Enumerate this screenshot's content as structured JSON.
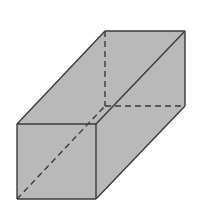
{
  "diagram": {
    "type": "rectangular-prism",
    "fill_color": "#b9b9b9",
    "stroke_color": "#3a3a3a",
    "background": "#ffffff",
    "vertices": {
      "front_top_left": [
        17,
        124
      ],
      "front_top_right": [
        96,
        124
      ],
      "front_bottom_right": [
        96,
        199
      ],
      "front_bottom_left": [
        17,
        199
      ],
      "back_top_left": [
        105,
        31
      ],
      "back_top_right": [
        185,
        31
      ],
      "back_bottom_right": [
        185,
        106
      ],
      "back_bottom_left": [
        105,
        106
      ]
    },
    "solid_edges": [
      [
        "front_top_left",
        "front_top_right"
      ],
      [
        "front_top_right",
        "front_bottom_right"
      ],
      [
        "front_bottom_right",
        "front_bottom_left"
      ],
      [
        "front_bottom_left",
        "front_top_left"
      ],
      [
        "front_top_left",
        "back_top_left"
      ],
      [
        "back_top_left",
        "back_top_right"
      ],
      [
        "back_top_right",
        "back_bottom_right"
      ],
      [
        "front_top_right",
        "back_top_right"
      ],
      [
        "front_bottom_right",
        "back_bottom_right"
      ]
    ],
    "hidden_edges": [
      [
        "back_top_left",
        "back_bottom_left"
      ],
      [
        "back_bottom_left",
        "back_bottom_right"
      ],
      [
        "front_bottom_left",
        "back_bottom_left"
      ]
    ]
  }
}
